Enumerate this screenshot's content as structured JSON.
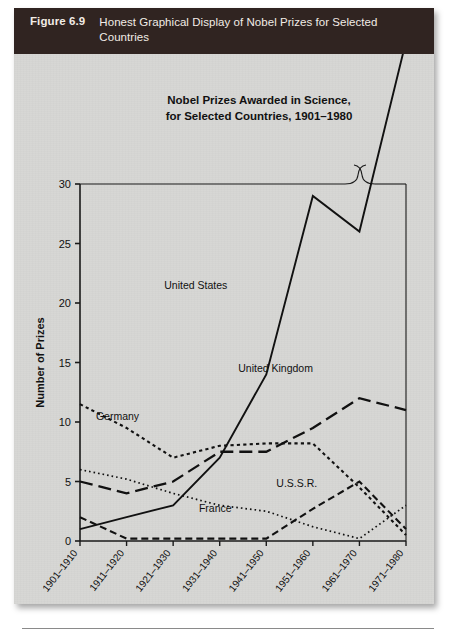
{
  "figure": {
    "number_label": "Figure 6.9",
    "caption": "Honest Graphical Display of Nobel Prizes for Selected Countries"
  },
  "chart_data": {
    "type": "line",
    "title": "Nobel Prizes Awarded in Science,",
    "title_line2": "for Selected Countries, 1901–1980",
    "xlabel": "",
    "ylabel": "Number of Prizes",
    "ylim": [
      0,
      30
    ],
    "yticks": [
      0,
      5,
      10,
      15,
      20,
      25,
      30
    ],
    "grid": false,
    "legend_position": "inline-labels",
    "axis_break_top": true,
    "categories": [
      "1901–1910",
      "1911–1920",
      "1921–1930",
      "1931–1940",
      "1941–1950",
      "1951–1960",
      "1961–1970",
      "1971–1980"
    ],
    "series": [
      {
        "name": "United States",
        "style": "solid",
        "label": "United States",
        "values": [
          1,
          2,
          3,
          7,
          14,
          29,
          26,
          42
        ]
      },
      {
        "name": "United Kingdom",
        "style": "long-dash",
        "label": "United Kingdom",
        "values": [
          5,
          4,
          5,
          7.5,
          7.5,
          9.5,
          12,
          11
        ]
      },
      {
        "name": "Germany",
        "style": "dotted-coarse",
        "label": "Germany",
        "values": [
          11.5,
          9.5,
          7,
          8,
          8.2,
          8.2,
          4.5,
          0.5
        ]
      },
      {
        "name": "France",
        "style": "dotted-fine",
        "label": "France",
        "values": [
          6,
          5.2,
          4,
          3,
          2.5,
          1.2,
          0.2,
          3
        ]
      },
      {
        "name": "U.S.S.R.",
        "style": "short-dash",
        "label": "U.S.S.R.",
        "values": [
          2,
          0.2,
          0.2,
          0.2,
          0.2,
          2.7,
          5,
          1
        ]
      }
    ],
    "annotations": [
      {
        "text": "United States",
        "x_frac": 0.355,
        "y_value": 21.2
      },
      {
        "text": "United Kingdom",
        "x_frac": 0.6,
        "y_value": 14.2
      },
      {
        "text": "Germany",
        "x_frac": 0.115,
        "y_value": 10.2
      },
      {
        "text": "France",
        "x_frac": 0.415,
        "y_value": 2.4
      },
      {
        "text": "U.S.S.R.",
        "x_frac": 0.665,
        "y_value": 4.5
      }
    ]
  }
}
